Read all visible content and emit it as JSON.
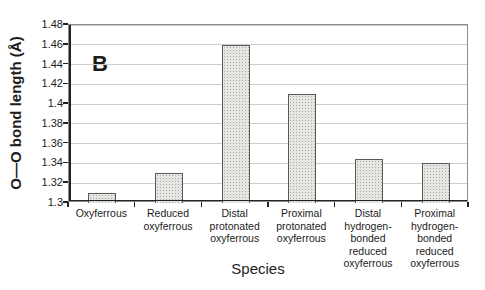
{
  "panel_label": "B",
  "chart_data": {
    "type": "bar",
    "title": "",
    "xlabel": "Species",
    "ylabel": "O—O bond length (Å)",
    "ylim": [
      1.3,
      1.48
    ],
    "grid": true,
    "legend": "none",
    "yticks": [
      {
        "value": 1.3,
        "label": "1.3"
      },
      {
        "value": 1.32,
        "label": "1.32"
      },
      {
        "value": 1.34,
        "label": "1.34"
      },
      {
        "value": 1.36,
        "label": "1.36"
      },
      {
        "value": 1.38,
        "label": "1.38"
      },
      {
        "value": 1.4,
        "label": "1.4"
      },
      {
        "value": 1.42,
        "label": "1.42"
      },
      {
        "value": 1.44,
        "label": "1.44"
      },
      {
        "value": 1.46,
        "label": "1.46"
      },
      {
        "value": 1.48,
        "label": "1.48"
      }
    ],
    "categories": [
      "Oxyferrous",
      "Reduced\noxyferrous",
      "Distal\nprotonated\noxyferrous",
      "Proximal\nprotonated\noxyferrous",
      "Distal\nhydrogen-\nbonded\nreduced\noxyferrous",
      "Proximal\nhydrogen-\nbonded\nreduced\noxyferrous"
    ],
    "values": [
      1.31,
      1.33,
      1.46,
      1.41,
      1.345,
      1.34
    ],
    "colors": {
      "bar_fill": "#e5e5e1",
      "bar_dot": "#a9a9a2",
      "bar_border": "#5a5a5a",
      "gridline": "#cccccc",
      "axis": "#222222",
      "frame": "#8a8a8a",
      "text": "#1c1c1c"
    }
  }
}
